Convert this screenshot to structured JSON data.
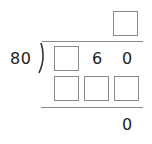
{
  "problem": {
    "type": "long-division",
    "divisor": "80",
    "quotient": {
      "boxes": [
        ""
      ]
    },
    "dividend": {
      "cells": [
        {
          "kind": "box",
          "value": ""
        },
        {
          "kind": "digit",
          "value": "6"
        },
        {
          "kind": "digit",
          "value": "0"
        }
      ]
    },
    "product_row": {
      "boxes": [
        "",
        "",
        ""
      ]
    },
    "remainder": "0"
  },
  "colors": {
    "line": "#8a8a8a",
    "text": "#222222",
    "background": "#ffffff"
  }
}
